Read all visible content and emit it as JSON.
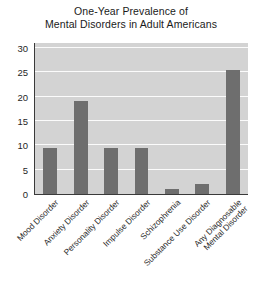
{
  "chart_data": {
    "type": "bar",
    "title": "One-Year Prevalence of Mental Disorders in Adult Americans",
    "title_lines": [
      "One-Year Prevalence of",
      "Mental Disorders in Adult Americans"
    ],
    "xlabel": "",
    "ylabel": "",
    "ylim": [
      0,
      31
    ],
    "yticks": [
      0,
      5,
      10,
      15,
      20,
      25,
      30
    ],
    "ytick_labels": [
      "0",
      "5",
      "10",
      "15",
      "20",
      "25",
      "30"
    ],
    "grid": true,
    "grid_axis": "y",
    "legend": false,
    "legend_position": "none",
    "categories": [
      "Mood Disorder",
      "Anxiety Disorder",
      "Personality Disorder",
      "Impulse Disorder",
      "Schizophrenia",
      "Substance Use Disorder",
      "Any Diagnosable Mental Disorder"
    ],
    "category_label_lines": [
      [
        "Mood Disorder"
      ],
      [
        "Anxiety Disorder"
      ],
      [
        "Personality Disorder"
      ],
      [
        "Impulse Disorder"
      ],
      [
        "Schizophrenia"
      ],
      [
        "Substance Use Disorder"
      ],
      [
        "Any Diagnosable",
        "Mental Disorder"
      ]
    ],
    "values": [
      9.5,
      19,
      9.5,
      9.5,
      1,
      2,
      25.5
    ],
    "colors": {
      "bar": "#6e6e6e",
      "plot_background": "#d3d3d3",
      "gridline": "#fbfbfb",
      "axis": "#3a3a3a",
      "text": "#1f1f1f",
      "page_background": "#ffffff"
    }
  }
}
